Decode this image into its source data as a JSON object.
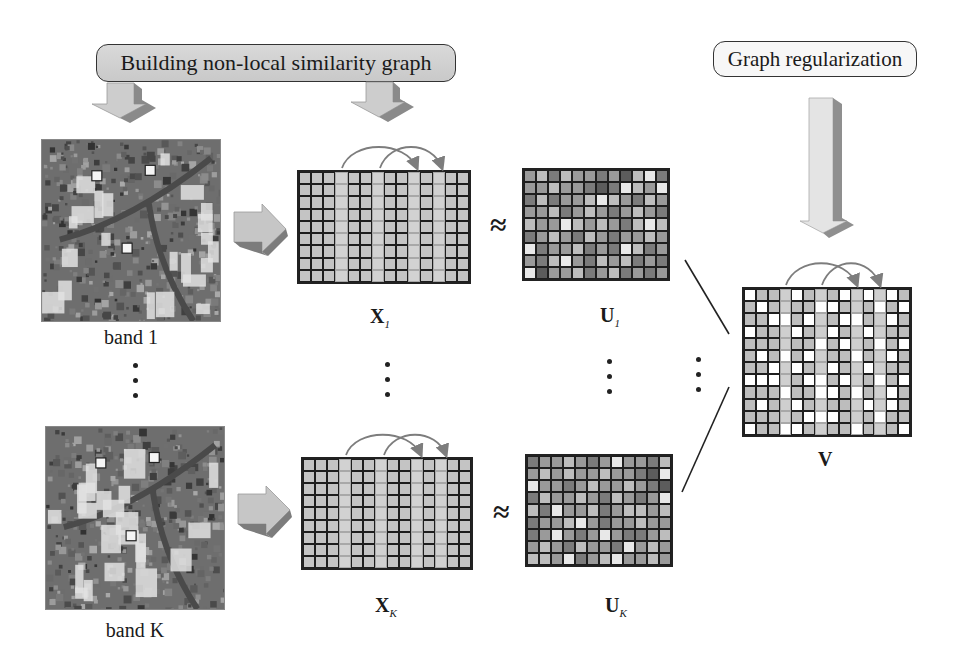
{
  "banners": {
    "build_graph": "Building non-local similarity graph",
    "graph_reg": "Graph regularization"
  },
  "images": {
    "band_1_label": "band 1",
    "band_k_label": "band K"
  },
  "matrices": {
    "x1": {
      "symbol": "X",
      "subscript": "1"
    },
    "xk": {
      "symbol": "X",
      "subscript": "K"
    },
    "u1": {
      "symbol": "U",
      "subscript": "1"
    },
    "uk": {
      "symbol": "U",
      "subscript": "K"
    },
    "v": {
      "symbol": "V",
      "subscript": ""
    }
  },
  "operators": {
    "approx_symbol": "≈"
  },
  "colors": {
    "x_cell": "#c4c4c4",
    "x_highlight_cell": "#d2d2d2",
    "grid_border": "#1e1e1e",
    "arrow_fill": "#c8c8c8",
    "arrow_shade": "#7a7a7a",
    "curve_arrow": "#7d7d7d"
  },
  "x_grid": {
    "cols": 14,
    "rows": 9,
    "highlight_cols": [
      3,
      6,
      9,
      11
    ],
    "links": [
      [
        3,
        9
      ],
      [
        6,
        11
      ]
    ]
  },
  "u1_grid": {
    "cols": 12,
    "rows": 9,
    "values": [
      [
        2,
        1,
        3,
        1,
        2,
        2,
        3,
        2,
        4,
        1,
        0,
        3
      ],
      [
        2,
        2,
        1,
        2,
        2,
        3,
        4,
        3,
        0,
        1,
        2,
        0
      ],
      [
        3,
        1,
        3,
        2,
        2,
        1,
        0,
        1,
        2,
        3,
        1,
        2
      ],
      [
        2,
        2,
        1,
        3,
        2,
        1,
        2,
        3,
        2,
        1,
        2,
        3
      ],
      [
        1,
        2,
        2,
        0,
        1,
        2,
        1,
        2,
        3,
        1,
        0,
        1
      ],
      [
        3,
        2,
        1,
        2,
        3,
        1,
        2,
        3,
        2,
        2,
        1,
        2
      ],
      [
        0,
        3,
        2,
        2,
        1,
        3,
        2,
        3,
        0,
        1,
        3,
        2
      ],
      [
        2,
        3,
        1,
        0,
        2,
        3,
        1,
        2,
        1,
        3,
        2,
        3
      ],
      [
        0,
        4,
        2,
        2,
        1,
        3,
        2,
        1,
        3,
        2,
        3,
        2
      ]
    ]
  },
  "uk_grid": {
    "cols": 12,
    "rows": 9,
    "values": [
      [
        3,
        2,
        2,
        1,
        2,
        3,
        2,
        0,
        2,
        2,
        3,
        1
      ],
      [
        2,
        1,
        2,
        1,
        2,
        2,
        1,
        2,
        2,
        3,
        4,
        0
      ],
      [
        0,
        2,
        2,
        3,
        2,
        1,
        2,
        2,
        1,
        2,
        3,
        4
      ],
      [
        3,
        1,
        2,
        2,
        1,
        2,
        3,
        1,
        2,
        3,
        2,
        0
      ],
      [
        1,
        3,
        0,
        2,
        2,
        1,
        3,
        2,
        1,
        1,
        2,
        1
      ],
      [
        3,
        2,
        2,
        1,
        0,
        2,
        3,
        2,
        2,
        1,
        2,
        2
      ],
      [
        3,
        2,
        0,
        2,
        3,
        2,
        0,
        2,
        3,
        3,
        2,
        1
      ],
      [
        2,
        1,
        2,
        3,
        1,
        2,
        2,
        3,
        0,
        2,
        1,
        2
      ],
      [
        1,
        1,
        2,
        0,
        3,
        2,
        1,
        0,
        2,
        2,
        1,
        2
      ]
    ]
  },
  "v_grid": {
    "cols": 14,
    "rows": 12,
    "highlight_cols": [
      3,
      6,
      9,
      11
    ],
    "links": [
      [
        3,
        9
      ],
      [
        6,
        11
      ]
    ],
    "white_cells": [
      [
        0,
        0
      ],
      [
        0,
        4
      ],
      [
        0,
        8
      ],
      [
        0,
        10
      ],
      [
        0,
        12
      ],
      [
        1,
        1
      ],
      [
        1,
        6
      ],
      [
        1,
        7
      ],
      [
        1,
        11
      ],
      [
        1,
        13
      ],
      [
        2,
        2
      ],
      [
        2,
        3
      ],
      [
        2,
        5
      ],
      [
        2,
        8
      ],
      [
        2,
        9
      ],
      [
        2,
        12
      ],
      [
        3,
        0
      ],
      [
        3,
        4
      ],
      [
        3,
        7
      ],
      [
        3,
        10
      ],
      [
        4,
        6
      ],
      [
        4,
        8
      ],
      [
        4,
        11
      ],
      [
        4,
        13
      ],
      [
        5,
        1
      ],
      [
        5,
        3
      ],
      [
        5,
        5
      ],
      [
        5,
        9
      ],
      [
        5,
        12
      ],
      [
        6,
        2
      ],
      [
        6,
        4
      ],
      [
        6,
        7
      ],
      [
        6,
        10
      ],
      [
        7,
        0
      ],
      [
        7,
        1
      ],
      [
        7,
        2
      ],
      [
        7,
        5
      ],
      [
        7,
        6
      ],
      [
        7,
        8
      ],
      [
        7,
        11
      ],
      [
        7,
        13
      ],
      [
        8,
        3
      ],
      [
        8,
        6
      ],
      [
        8,
        7
      ],
      [
        8,
        9
      ],
      [
        8,
        12
      ],
      [
        9,
        1
      ],
      [
        9,
        4
      ],
      [
        9,
        10
      ],
      [
        9,
        12
      ],
      [
        10,
        5
      ],
      [
        10,
        6
      ],
      [
        10,
        7
      ],
      [
        10,
        11
      ],
      [
        11,
        0
      ],
      [
        11,
        3
      ],
      [
        11,
        4
      ],
      [
        11,
        9
      ],
      [
        11,
        13
      ]
    ]
  }
}
